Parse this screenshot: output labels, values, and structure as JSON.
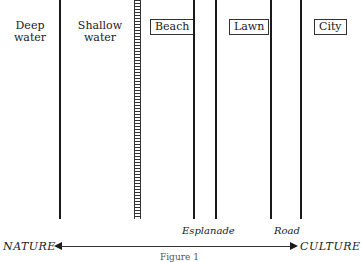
{
  "zones": [
    {
      "label_line1": "Deep",
      "label_line2": "water"
    },
    {
      "label_line1": "Shallow",
      "label_line2": "water"
    },
    {
      "label": "Beach"
    },
    {
      "label": "Lawn"
    },
    {
      "label": "City"
    }
  ],
  "boundaries": {
    "esplanade": "Esplanade",
    "road": "Road"
  },
  "axis": {
    "left": "NATURE",
    "right": "CULTURE"
  },
  "caption": "Figure 1"
}
